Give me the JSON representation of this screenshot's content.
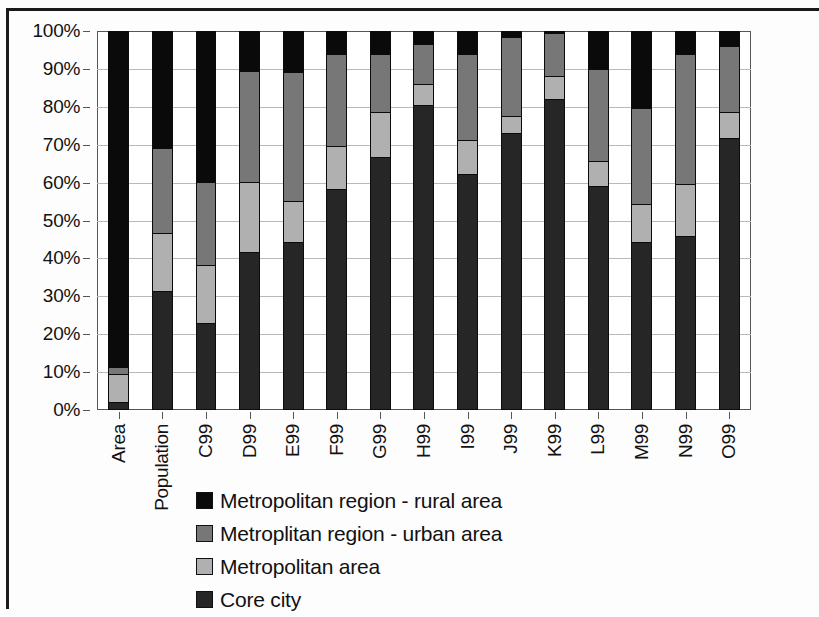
{
  "chart_data": {
    "type": "bar",
    "subtype": "stacked-100-percent",
    "title": "",
    "subtitle": "",
    "xlabel": "",
    "ylabel": "",
    "ylim": [
      0,
      100
    ],
    "ytick_labels": [
      "0%",
      "10%",
      "20%",
      "30%",
      "40%",
      "50%",
      "60%",
      "70%",
      "80%",
      "90%",
      "100%"
    ],
    "ytick_values": [
      0,
      10,
      20,
      30,
      40,
      50,
      60,
      70,
      80,
      90,
      100
    ],
    "grid": true,
    "grid_axis": "y",
    "legend_position": "bottom",
    "stack_order_bottom_to_top": [
      "Core city",
      "Metropolitan area",
      "Metroplitan region - urban area",
      "Metropolitan region - rural area"
    ],
    "categories": [
      "Area",
      "Population",
      "C99",
      "D99",
      "E99",
      "F99",
      "G99",
      "H99",
      "I99",
      "J99",
      "K99",
      "L99",
      "M99",
      "N99",
      "O99"
    ],
    "series": [
      {
        "name": "Core city",
        "color": "#262626",
        "values": [
          1.5,
          31.0,
          22.5,
          41.5,
          44.0,
          58.0,
          66.5,
          80.5,
          62.0,
          73.0,
          82.0,
          59.0,
          44.0,
          45.5,
          71.5
        ]
      },
      {
        "name": "Metropolitan area",
        "color": "#b0b0b0",
        "values": [
          7.5,
          15.5,
          15.5,
          18.5,
          11.0,
          11.5,
          12.0,
          5.5,
          9.0,
          4.5,
          6.0,
          6.5,
          10.0,
          14.0,
          7.0
        ]
      },
      {
        "name": "Metroplitan region - urban area",
        "color": "#777777",
        "values": [
          2.0,
          22.5,
          22.0,
          29.5,
          34.0,
          24.5,
          15.5,
          10.5,
          23.0,
          21.0,
          11.5,
          24.5,
          25.5,
          34.5,
          17.5
        ]
      },
      {
        "name": "Metropolitan region - rural area",
        "color": "#0a0a0a",
        "values": [
          89.0,
          31.0,
          40.0,
          10.5,
          11.0,
          6.0,
          6.0,
          3.5,
          6.0,
          1.5,
          0.5,
          10.0,
          20.5,
          6.0,
          4.0
        ]
      }
    ],
    "cumulative_tops": {
      "Area": [
        1.5,
        9.0,
        11.0,
        100
      ],
      "Population": [
        31.0,
        46.5,
        69.0,
        100
      ],
      "C99": [
        22.5,
        38.0,
        60.0,
        100
      ],
      "D99": [
        41.5,
        60.0,
        89.5,
        100
      ],
      "E99": [
        44.0,
        55.0,
        89.0,
        100
      ],
      "F99": [
        58.0,
        69.5,
        94.0,
        100
      ],
      "G99": [
        66.5,
        78.5,
        94.0,
        100
      ],
      "H99": [
        80.5,
        86.0,
        96.5,
        100
      ],
      "I99": [
        62.0,
        71.0,
        94.0,
        100
      ],
      "J99": [
        73.0,
        77.5,
        98.5,
        100
      ],
      "K99": [
        82.0,
        88.0,
        99.5,
        100
      ],
      "L99": [
        59.0,
        65.5,
        90.0,
        100
      ],
      "M99": [
        44.0,
        54.0,
        79.5,
        100
      ],
      "N99": [
        45.5,
        59.5,
        94.0,
        100
      ],
      "O99": [
        71.5,
        78.5,
        96.0,
        100
      ]
    }
  },
  "legend": {
    "items": [
      {
        "label": "Metropolitan region - rural area",
        "color": "#0a0a0a",
        "swatch_name": "legend-swatch-rural"
      },
      {
        "label": "Metroplitan region - urban area",
        "color": "#777777",
        "swatch_name": "legend-swatch-urban"
      },
      {
        "label": "Metropolitan area",
        "color": "#b0b0b0",
        "swatch_name": "legend-swatch-metro-area"
      },
      {
        "label": "Core city",
        "color": "#262626",
        "swatch_name": "legend-swatch-core-city"
      }
    ]
  }
}
